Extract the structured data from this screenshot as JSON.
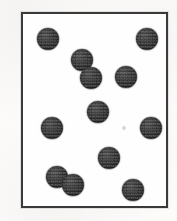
{
  "figure": {
    "title": "Scatter of dark circular particles inside a rectangular frame",
    "background_color": "#fcfbfa",
    "frame": {
      "name": "plot-border",
      "color": "#3a3a3a",
      "stroke_px": 2,
      "x": 21,
      "y": 12,
      "width": 147,
      "height": 196
    },
    "particle_style": {
      "fill_color": "#2b2b2b",
      "edge_color": "#1c1c1c",
      "shape": "filled-circle",
      "texture": "halftone-stipple"
    }
  },
  "chart_data": {
    "type": "scatter",
    "title": "Scatter of dark circular particles inside a rectangular frame",
    "xlabel": "",
    "ylabel": "",
    "xlim": [
      0,
      147
    ],
    "ylim": [
      0,
      196
    ],
    "grid": false,
    "legend": null,
    "marker": "filled-circle",
    "marker_color": "#2b2b2b",
    "marker_radius_px": 11,
    "count": 12,
    "note": "Coordinates are pixel positions of circle centers relative to the inner top-left of the drawn frame; y increases downward.",
    "points": [
      {
        "id": 1,
        "label": "top-left",
        "x": 25,
        "y": 25,
        "r": 11
      },
      {
        "id": 2,
        "label": "top-right",
        "x": 124,
        "y": 25,
        "r": 11
      },
      {
        "id": 3,
        "label": "upper-pair-top",
        "x": 59,
        "y": 46,
        "r": 11
      },
      {
        "id": 4,
        "label": "upper-pair-bottom",
        "x": 68,
        "y": 64,
        "r": 11
      },
      {
        "id": 5,
        "label": "upper-right-inner",
        "x": 103,
        "y": 63,
        "r": 11
      },
      {
        "id": 6,
        "label": "center",
        "x": 75,
        "y": 98,
        "r": 11
      },
      {
        "id": 7,
        "label": "left-middle",
        "x": 29,
        "y": 114,
        "r": 11
      },
      {
        "id": 8,
        "label": "right-middle",
        "x": 128,
        "y": 114,
        "r": 11
      },
      {
        "id": 9,
        "label": "lower-center",
        "x": 86,
        "y": 144,
        "r": 11
      },
      {
        "id": 10,
        "label": "lower-pair-left",
        "x": 34,
        "y": 163,
        "r": 11
      },
      {
        "id": 11,
        "label": "lower-pair-right",
        "x": 50,
        "y": 171,
        "r": 11
      },
      {
        "id": 12,
        "label": "bottom-right",
        "x": 110,
        "y": 176,
        "r": 11
      }
    ],
    "artifacts": [
      {
        "id": "speck-1",
        "label": "faint scan speck",
        "x": 99,
        "y": 111,
        "w": 4,
        "h": 6
      }
    ]
  }
}
